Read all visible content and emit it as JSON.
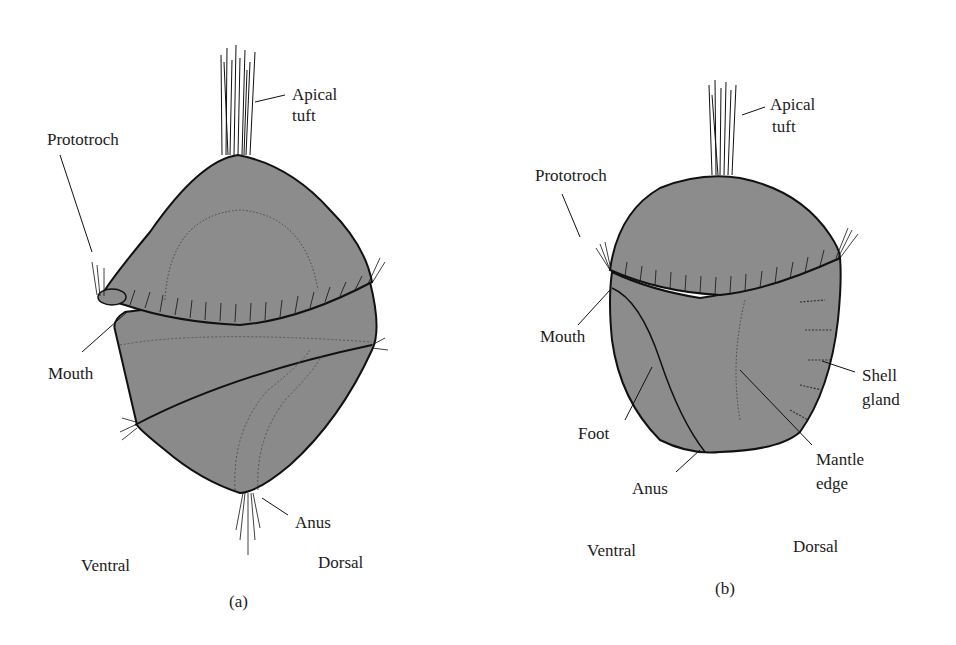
{
  "figure": {
    "panels": [
      {
        "id": "a",
        "caption": "(a)",
        "labels": {
          "apical_tuft_line1": "Apical",
          "apical_tuft_line2": "tuft",
          "prototroch": "Prototroch",
          "mouth": "Mouth",
          "anus": "Anus",
          "ventral": "Ventral",
          "dorsal": "Dorsal"
        }
      },
      {
        "id": "b",
        "caption": "(b)",
        "labels": {
          "apical_tuft_line1": "Apical",
          "apical_tuft_line2": "tuft",
          "prototroch": "Prototroch",
          "mouth": "Mouth",
          "foot": "Foot",
          "anus": "Anus",
          "shell_gland_line1": "Shell",
          "shell_gland_line2": "gland",
          "mantle_edge_line1": "Mantle",
          "mantle_edge_line2": "edge",
          "ventral": "Ventral",
          "dorsal": "Dorsal"
        }
      }
    ],
    "colors": {
      "body_fill": "#8c8c8c",
      "outline": "#111111",
      "background": "#ffffff"
    }
  }
}
